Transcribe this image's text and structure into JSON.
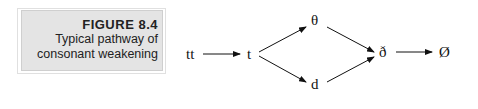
{
  "caption": {
    "label": "FIGURE 8.4",
    "line1": "Typical pathway of",
    "line2": "consonant weakening"
  },
  "diagram": {
    "nodes": {
      "tt": "tt",
      "t": "t",
      "theta": "θ",
      "d": "d",
      "eth": "ð",
      "zero": "Ø"
    },
    "edges": [
      [
        "tt",
        "t"
      ],
      [
        "t",
        "theta"
      ],
      [
        "t",
        "d"
      ],
      [
        "theta",
        "eth"
      ],
      [
        "d",
        "eth"
      ],
      [
        "eth",
        "zero"
      ]
    ]
  }
}
